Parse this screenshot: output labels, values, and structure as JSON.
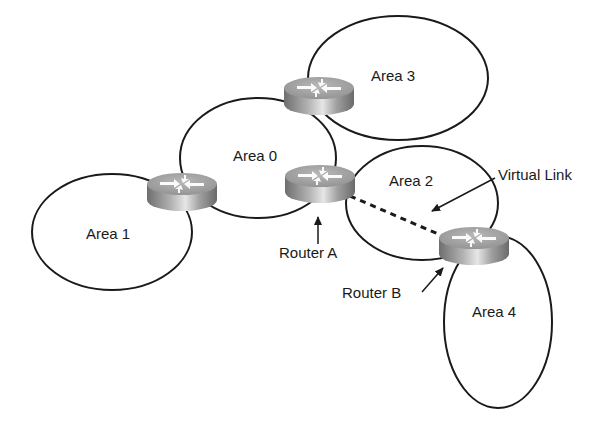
{
  "diagram": {
    "type": "OSPF area topology with virtual link",
    "areas": [
      {
        "id": "area0",
        "label": "Area 0"
      },
      {
        "id": "area1",
        "label": "Area 1"
      },
      {
        "id": "area2",
        "label": "Area 2"
      },
      {
        "id": "area3",
        "label": "Area 3"
      },
      {
        "id": "area4",
        "label": "Area 4"
      }
    ],
    "routers": [
      {
        "id": "r-area0-area1",
        "label": ""
      },
      {
        "id": "r-area0-area3",
        "label": ""
      },
      {
        "id": "router-a",
        "label": "Router A"
      },
      {
        "id": "router-b",
        "label": "Router B"
      }
    ],
    "links": [
      {
        "from": "router-a",
        "to": "router-b",
        "style": "dashed",
        "label": "Virtual Link"
      }
    ],
    "colors": {
      "line": "#1a1a1a",
      "router_top": "#a8a8a8",
      "router_side": "#8c8c8c",
      "background": "#ffffff"
    }
  }
}
